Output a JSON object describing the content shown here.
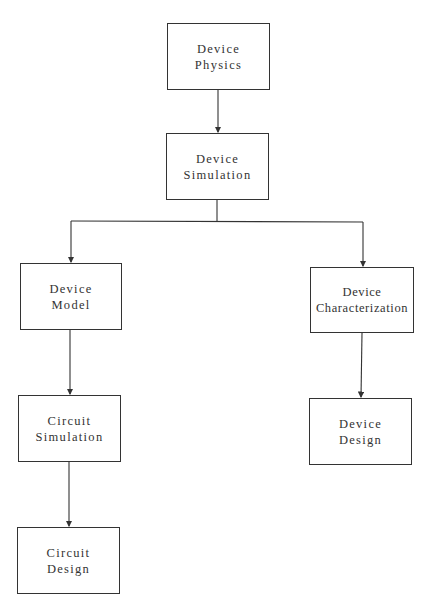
{
  "diagram": {
    "type": "flowchart",
    "nodes": [
      {
        "id": "device-physics",
        "line1": "Device",
        "line2": "Physics",
        "x": 167,
        "y": 23,
        "w": 103,
        "h": 67
      },
      {
        "id": "device-simulation",
        "line1": "Device",
        "line2": "Simulation",
        "x": 166,
        "y": 133,
        "w": 103,
        "h": 67
      },
      {
        "id": "device-model",
        "line1": "Device",
        "line2": "Model",
        "x": 20,
        "y": 263,
        "w": 102,
        "h": 67
      },
      {
        "id": "device-characterization",
        "line1": "Device",
        "line2": "Characterization",
        "x": 310,
        "y": 267,
        "w": 104,
        "h": 66
      },
      {
        "id": "circuit-simulation",
        "line1": "Circuit",
        "line2": "Simulation",
        "x": 18,
        "y": 395,
        "w": 103,
        "h": 67
      },
      {
        "id": "device-design",
        "line1": "Device",
        "line2": "Design",
        "x": 309,
        "y": 398,
        "w": 103,
        "h": 67
      },
      {
        "id": "circuit-design",
        "line1": "Circuit",
        "line2": "Design",
        "x": 17,
        "y": 527,
        "w": 103,
        "h": 67
      }
    ],
    "edges": [
      {
        "from": "device-physics",
        "to": "device-simulation"
      },
      {
        "from": "device-simulation",
        "to": "device-model"
      },
      {
        "from": "device-simulation",
        "to": "device-characterization"
      },
      {
        "from": "device-model",
        "to": "circuit-simulation"
      },
      {
        "from": "circuit-simulation",
        "to": "circuit-design"
      },
      {
        "from": "device-characterization",
        "to": "device-design"
      }
    ],
    "colors": {
      "line": "#333333",
      "text": "#333333",
      "background": "#ffffff"
    }
  }
}
